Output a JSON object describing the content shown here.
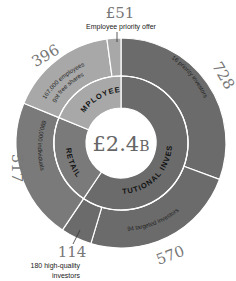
{
  "chart_data": {
    "type": "pie",
    "subtype": "sunburst-donut",
    "title": "",
    "center_label": {
      "prefix": "£2.4",
      "suffix": "B"
    },
    "total": 2376,
    "unit": "£ millions",
    "inner_ring": [
      {
        "name": "INSTITUTIONAL INVESTORS",
        "value": 1412,
        "color": "#6b6b6b"
      },
      {
        "name": "RETAIL",
        "value": 517,
        "color": "#7a7a7a"
      },
      {
        "name": "EMPLOYEES",
        "value": 447,
        "color": "#a8a8a8"
      }
    ],
    "outer_ring": [
      {
        "label": "728",
        "value": 728,
        "note": "16 priority investors",
        "group": "INSTITUTIONAL INVESTORS",
        "color": "#6b6b6b"
      },
      {
        "label": "570",
        "value": 570,
        "note": "94 targeted investors",
        "group": "INSTITUTIONAL INVESTORS",
        "color": "#6b6b6b"
      },
      {
        "label": "114",
        "value": 114,
        "note": "180 high-quality investors",
        "group": "INSTITUTIONAL INVESTORS",
        "color": "#6b6b6b"
      },
      {
        "label": "517",
        "value": 517,
        "note": "690,000 individuals",
        "group": "RETAIL",
        "color": "#7a7a7a"
      },
      {
        "label": "396",
        "value": 396,
        "note": "167,000 employees got free shares",
        "group": "EMPLOYEES",
        "color": "#a8a8a8"
      },
      {
        "label": "£51",
        "value": 51,
        "note": "Employee priority offer",
        "group": "EMPLOYEES",
        "color": "#a8a8a8"
      }
    ],
    "start_angle_deg": 0,
    "direction": "clockwise"
  },
  "labels": {
    "v728": "728",
    "v570": "570",
    "v114": "114",
    "v517": "517",
    "v396": "396",
    "v51": "£51",
    "note51": "Employee priority offer",
    "note114_line1": "180 high-quality",
    "note114_line2": "investors",
    "center_main": "£2.4",
    "center_suffix": "B",
    "ring_institutional": "INSTITUTIONAL INVESTORS",
    "ring_retail": "RETAIL",
    "ring_employees": "EMPLOYEES",
    "note728": "16 priority investors",
    "note570": "94 targeted investors",
    "note517": "690,000 individuals",
    "note396_line1": "167,000 employees",
    "note396_line2": "got free shares"
  }
}
